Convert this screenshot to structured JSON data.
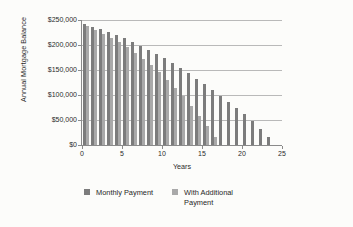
{
  "chart_data": {
    "type": "bar",
    "title": "",
    "subtitle": "",
    "xlabel": "Years",
    "ylabel": "Annual Mortgage Balance",
    "xlim": [
      0,
      25
    ],
    "ylim": [
      0,
      250000
    ],
    "grid": true,
    "legend_position": "bottom",
    "x_tick_labels": [
      "0",
      "5",
      "10",
      "15",
      "20",
      "25"
    ],
    "x_tick_values": [
      0,
      5,
      10,
      15,
      20,
      25
    ],
    "y_tick_labels": [
      "$0",
      "$50,000",
      "$100,000",
      "$150,000",
      "$200,000",
      "$250,000"
    ],
    "y_tick_values": [
      0,
      50000,
      100000,
      150000,
      200000,
      250000
    ],
    "categories": [
      1,
      2,
      3,
      4,
      5,
      6,
      7,
      8,
      9,
      10,
      11,
      12,
      13,
      14,
      15,
      16,
      17,
      18,
      19,
      20,
      21,
      22,
      23,
      24
    ],
    "series": [
      {
        "name": "Monthly Payment",
        "color": "#7c7c7c",
        "values": [
          242000,
          237000,
          232000,
          226000,
          220000,
          214000,
          207000,
          199000,
          191000,
          183000,
          174000,
          164000,
          154000,
          144000,
          133000,
          122000,
          111000,
          99000,
          87000,
          75000,
          62000,
          48000,
          33000,
          17000
        ]
      },
      {
        "name": "With Additional Payment",
        "color": "#a9a9a9",
        "values": [
          238000,
          231000,
          223000,
          215000,
          206000,
          196000,
          185000,
          173000,
          160000,
          146000,
          131000,
          115000,
          98000,
          79000,
          59000,
          38000,
          16000,
          0,
          0,
          0,
          0,
          0,
          0,
          0
        ]
      }
    ]
  },
  "legend": {
    "entries": [
      {
        "label": "Monthly Payment",
        "color": "#7c7c7c"
      },
      {
        "label": "With Additional Payment",
        "color": "#a9a9a9"
      }
    ]
  }
}
